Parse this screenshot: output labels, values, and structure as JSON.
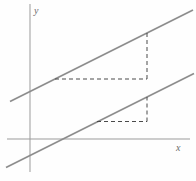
{
  "figure": {
    "colors": {
      "background": "#fefefe",
      "axis": "#9b9b9b",
      "line": "#8d8d8d",
      "dash": "#4a4a4a",
      "label": "#6b6b6b"
    },
    "axes": {
      "x_label": "x",
      "y_label": "y",
      "x_axis": {
        "x1": 7,
        "y1": 139,
        "x2": 190,
        "y2": 139
      },
      "y_axis": {
        "x1": 30,
        "y1": 4,
        "x2": 30,
        "y2": 172
      }
    },
    "parallel_lines": [
      {
        "name": "upper-parallel-line",
        "x1": 10,
        "y1": 101.5,
        "x2": 193,
        "y2": 10
      },
      {
        "name": "lower-parallel-line",
        "x1": 6,
        "y1": 167.5,
        "x2": 194,
        "y2": 73.5
      }
    ],
    "dashed_segments": [
      {
        "name": "upper-run-dashed",
        "x1": 55,
        "y1": 79,
        "x2": 147,
        "y2": 79
      },
      {
        "name": "upper-rise-dashed",
        "x1": 147,
        "y1": 79,
        "x2": 147,
        "y2": 33
      },
      {
        "name": "lower-run-dashed",
        "x1": 97,
        "y1": 121.5,
        "x2": 147,
        "y2": 121.5
      },
      {
        "name": "lower-rise-dashed",
        "x1": 147,
        "y1": 121.5,
        "x2": 147,
        "y2": 97
      }
    ],
    "dash_pattern": "4,3"
  }
}
